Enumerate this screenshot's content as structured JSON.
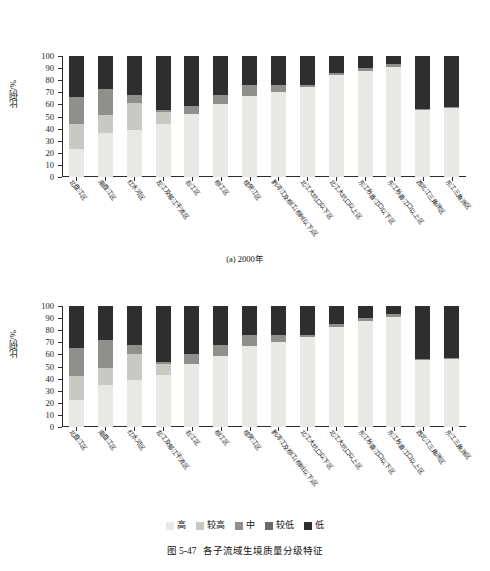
{
  "figure": {
    "caption_number": "图 5-47",
    "caption_text": "各子流域生境质量分级特征"
  },
  "legend": {
    "position": "bottom-center",
    "items": [
      {
        "label": "高",
        "color": "#e8e8e4"
      },
      {
        "label": "较高",
        "color": "#c9c9c4"
      },
      {
        "label": "中",
        "color": "#8f8f8c"
      },
      {
        "label": "较低",
        "color": "#6a6a68"
      },
      {
        "label": "低",
        "color": "#2e2e2e"
      }
    ]
  },
  "axis": {
    "ylabel": "比例/%",
    "yticks": [
      0,
      10,
      20,
      30,
      40,
      50,
      60,
      70,
      80,
      90,
      100
    ],
    "ylim": [
      0,
      100
    ]
  },
  "panels": [
    {
      "key": "a",
      "caption": "(a) 2000年"
    },
    {
      "key": "b",
      "caption": "(b) 2010年"
    }
  ],
  "chart_data": [
    {
      "type": "bar",
      "stacked": true,
      "percent": true,
      "title": "(a) 2000年",
      "xlabel": "",
      "ylabel": "比例/%",
      "ylim": [
        0,
        100
      ],
      "grid": false,
      "legend_position": "bottom",
      "categories": [
        "北盘江区",
        "南盘江区",
        "红水河区",
        "左江及郁江干流区",
        "右江区",
        "柳江区",
        "桂贺江区",
        "黔浔江及柳江(柳州以下)区",
        "北江大坑口以下区",
        "北江大坑口以上区",
        "东江秋香江口以下区",
        "东江秋香江口以上区",
        "西北江三角洲区",
        "东江三角洲区"
      ],
      "series": [
        {
          "name": "高",
          "color": "#e8e8e4",
          "values": [
            23,
            36,
            39,
            44,
            52,
            60,
            67,
            70,
            74,
            84,
            88,
            91,
            55,
            57
          ]
        },
        {
          "name": "较高",
          "color": "#c9c9c4",
          "values": [
            21,
            15,
            22,
            10,
            0,
            0,
            0,
            0,
            0,
            0,
            0,
            0,
            0,
            0
          ]
        },
        {
          "name": "中",
          "color": "#8f8f8c",
          "values": [
            22,
            22,
            7,
            1,
            7,
            8,
            9,
            6,
            2,
            2,
            2,
            2,
            1,
            1
          ]
        },
        {
          "name": "较低",
          "color": "#6a6a68",
          "values": [
            0,
            0,
            0,
            0,
            0,
            0,
            0,
            0,
            0,
            0,
            0,
            0,
            0,
            0
          ]
        },
        {
          "name": "低",
          "color": "#2e2e2e",
          "values": [
            34,
            27,
            32,
            45,
            41,
            32,
            24,
            24,
            24,
            14,
            10,
            7,
            44,
            42
          ]
        }
      ]
    },
    {
      "type": "bar",
      "stacked": true,
      "percent": true,
      "title": "(b) 2010年",
      "xlabel": "",
      "ylabel": "比例/%",
      "ylim": [
        0,
        100
      ],
      "grid": false,
      "legend_position": "bottom",
      "categories": [
        "北盘江区",
        "南盘江区",
        "红水河区",
        "左江及郁江干流区",
        "右江区",
        "柳江区",
        "桂贺江区",
        "黔浔江及柳江(柳州以下)区",
        "北江大坑口以下区",
        "北江大坑口以上区",
        "东江秋香江口以下区",
        "东江秋香江口以上区",
        "西北江三角洲区",
        "东江三角洲区"
      ],
      "series": [
        {
          "name": "高",
          "color": "#e8e8e4",
          "values": [
            22,
            35,
            39,
            43,
            52,
            59,
            67,
            70,
            74,
            83,
            88,
            91,
            55,
            56
          ]
        },
        {
          "name": "较高",
          "color": "#c9c9c4",
          "values": [
            20,
            14,
            21,
            9,
            0,
            0,
            0,
            0,
            0,
            0,
            0,
            0,
            0,
            0
          ]
        },
        {
          "name": "中",
          "color": "#8f8f8c",
          "values": [
            23,
            23,
            8,
            2,
            8,
            9,
            9,
            6,
            2,
            2,
            2,
            2,
            1,
            1
          ]
        },
        {
          "name": "较低",
          "color": "#6a6a68",
          "values": [
            0,
            0,
            0,
            0,
            0,
            0,
            0,
            0,
            0,
            0,
            0,
            0,
            0,
            0
          ]
        },
        {
          "name": "低",
          "color": "#2e2e2e",
          "values": [
            35,
            28,
            32,
            46,
            40,
            32,
            24,
            24,
            24,
            15,
            10,
            7,
            44,
            43
          ]
        }
      ]
    }
  ]
}
